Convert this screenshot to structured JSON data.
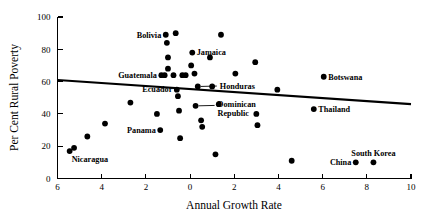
{
  "chart_data": {
    "type": "scatter",
    "title": "",
    "xlabel": "Annual Growth Rate",
    "ylabel": "Per Cent Rural Poverty",
    "xlim": [
      -6,
      10
    ],
    "ylim": [
      0,
      100
    ],
    "grid": false,
    "legend": "none",
    "x_ticks": [
      -6,
      -4,
      -2,
      0,
      2,
      4,
      6,
      8,
      10
    ],
    "x_tick_labels": [
      "6",
      "4",
      "2",
      "0",
      "2",
      "4",
      "6",
      "8",
      "10"
    ],
    "y_ticks": [
      0,
      20,
      40,
      60,
      80,
      100
    ],
    "y_tick_labels": [
      "0",
      "20",
      "40",
      "60",
      "80",
      "100"
    ],
    "points": [
      {
        "x": -5.45,
        "y": 17,
        "label": "Nicaragua",
        "label_pos": "below"
      },
      {
        "x": -5.25,
        "y": 19,
        "label": "",
        "label_pos": ""
      },
      {
        "x": -4.65,
        "y": 26,
        "label": "",
        "label_pos": ""
      },
      {
        "x": -3.85,
        "y": 34,
        "label": "",
        "label_pos": ""
      },
      {
        "x": -2.7,
        "y": 47,
        "label": "",
        "label_pos": ""
      },
      {
        "x": -1.5,
        "y": 40,
        "label": "",
        "label_pos": ""
      },
      {
        "x": -1.35,
        "y": 30,
        "label": "Panama",
        "label_pos": "left"
      },
      {
        "x": -1.15,
        "y": 64,
        "label": "",
        "label_pos": ""
      },
      {
        "x": -1.1,
        "y": 89,
        "label": "Bolivia",
        "label_pos": "left"
      },
      {
        "x": -1.05,
        "y": 84,
        "label": "",
        "label_pos": ""
      },
      {
        "x": -1.0,
        "y": 75,
        "label": "",
        "label_pos": ""
      },
      {
        "x": -1.0,
        "y": 68,
        "label": "",
        "label_pos": ""
      },
      {
        "x": -1.3,
        "y": 64,
        "label": "Guatemala",
        "label_pos": "left"
      },
      {
        "x": -0.75,
        "y": 64,
        "label": "",
        "label_pos": ""
      },
      {
        "x": -0.65,
        "y": 90,
        "label": "",
        "label_pos": ""
      },
      {
        "x": -0.6,
        "y": 55,
        "label": "Ecuador",
        "label_pos": "left"
      },
      {
        "x": -0.55,
        "y": 51,
        "label": "",
        "label_pos": ""
      },
      {
        "x": -0.5,
        "y": 42,
        "label": "",
        "label_pos": ""
      },
      {
        "x": -0.45,
        "y": 25,
        "label": "",
        "label_pos": ""
      },
      {
        "x": -0.35,
        "y": 64,
        "label": "",
        "label_pos": ""
      },
      {
        "x": -0.2,
        "y": 64,
        "label": "",
        "label_pos": ""
      },
      {
        "x": 0.05,
        "y": 70,
        "label": "",
        "label_pos": ""
      },
      {
        "x": 0.1,
        "y": 78,
        "label": "Jamaica",
        "label_pos": "right"
      },
      {
        "x": 0.2,
        "y": 65,
        "label": "",
        "label_pos": ""
      },
      {
        "x": 0.25,
        "y": 45,
        "label": "Dominican Republic",
        "label_pos": "leader"
      },
      {
        "x": 0.35,
        "y": 57,
        "label": "Honduras",
        "label_pos": "leader"
      },
      {
        "x": 0.5,
        "y": 36,
        "label": "",
        "label_pos": ""
      },
      {
        "x": 0.55,
        "y": 32,
        "label": "",
        "label_pos": ""
      },
      {
        "x": 0.9,
        "y": 75,
        "label": "",
        "label_pos": ""
      },
      {
        "x": 1.0,
        "y": 57,
        "label": "",
        "label_pos": ""
      },
      {
        "x": 1.15,
        "y": 15,
        "label": "",
        "label_pos": ""
      },
      {
        "x": 1.3,
        "y": 46,
        "label": "",
        "label_pos": ""
      },
      {
        "x": 1.4,
        "y": 89,
        "label": "",
        "label_pos": ""
      },
      {
        "x": 2.05,
        "y": 65,
        "label": "",
        "label_pos": ""
      },
      {
        "x": 2.95,
        "y": 72,
        "label": "",
        "label_pos": ""
      },
      {
        "x": 3.0,
        "y": 40,
        "label": "",
        "label_pos": ""
      },
      {
        "x": 3.05,
        "y": 33,
        "label": "",
        "label_pos": ""
      },
      {
        "x": 3.95,
        "y": 55,
        "label": "",
        "label_pos": ""
      },
      {
        "x": 4.6,
        "y": 11,
        "label": "",
        "label_pos": ""
      },
      {
        "x": 5.6,
        "y": 43,
        "label": "Thailand",
        "label_pos": "right"
      },
      {
        "x": 6.05,
        "y": 63,
        "label": "Botswana",
        "label_pos": "right"
      },
      {
        "x": 7.5,
        "y": 10,
        "label": "China",
        "label_pos": "left"
      },
      {
        "x": 8.3,
        "y": 10,
        "label": "South Korea",
        "label_pos": "above"
      }
    ],
    "trend_line": {
      "x_start": -6,
      "y_start": 61,
      "x_end": 10,
      "y_end": 46
    }
  }
}
